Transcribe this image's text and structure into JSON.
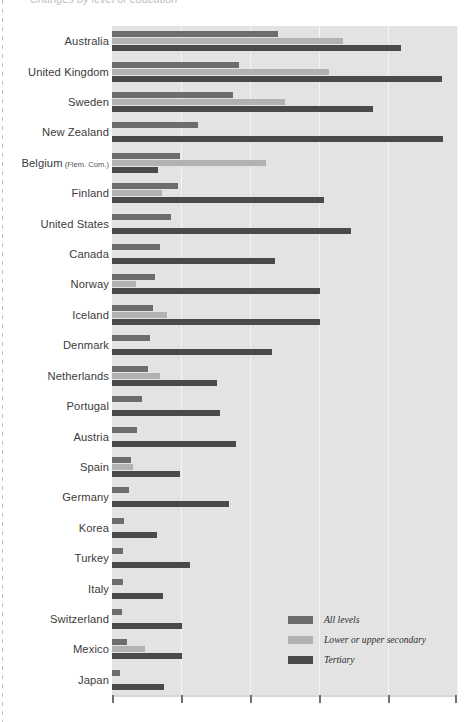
{
  "page": {
    "clipped_title": "Changes by level of education"
  },
  "legend": {
    "position": "inside-bottom-right",
    "items": [
      {
        "label": "All levels",
        "color": "#6d6d6d",
        "swatch_name": "legend-swatch-all-levels"
      },
      {
        "label": "Lower or upper secondary",
        "color": "#b2b2b2",
        "swatch_name": "legend-swatch-lower-upper-secondary"
      },
      {
        "label": "Tertiary",
        "color": "#4a4a4a",
        "swatch_name": "legend-swatch-tertiary"
      }
    ]
  },
  "axis": {
    "tick_count": 6,
    "tick_labels": [
      "",
      "",
      "",
      "",
      "",
      ""
    ],
    "xmin": 0,
    "xmax": 5
  },
  "chart_data": {
    "type": "bar",
    "orientation": "horizontal",
    "title": "Changes by level of education",
    "xlabel": "",
    "ylabel": "",
    "xlim": [
      0,
      5
    ],
    "grid": true,
    "legend_position": "inside-bottom-right",
    "categories": [
      "Australia",
      "United Kingdom",
      "Sweden",
      "New Zealand",
      "Belgium (Flem. Com.)",
      "Finland",
      "United States",
      "Canada",
      "Norway",
      "Iceland",
      "Denmark",
      "Netherlands",
      "Portugal",
      "Austria",
      "Spain",
      "Germany",
      "Korea",
      "Turkey",
      "Italy",
      "Switzerland",
      "Mexico",
      "Japan"
    ],
    "category_sublabels": {
      "Belgium (Flem. Com.)": {
        "main": "Belgium",
        "sub": "(Flem. Com.)"
      }
    },
    "series": [
      {
        "name": "All levels",
        "color": "#6d6d6d",
        "values": [
          2.41,
          1.84,
          1.75,
          1.25,
          0.98,
          0.96,
          0.86,
          0.7,
          0.62,
          0.59,
          0.55,
          0.52,
          0.44,
          0.36,
          0.28,
          0.25,
          0.17,
          0.16,
          0.16,
          0.15,
          0.22,
          0.12
        ]
      },
      {
        "name": "Lower or upper secondary",
        "color": "#b2b2b2",
        "values": [
          3.35,
          3.14,
          2.51,
          0.0,
          2.23,
          0.72,
          0.0,
          0.0,
          0.35,
          0.8,
          0.0,
          0.69,
          0.0,
          0.0,
          0.3,
          0.0,
          0.0,
          0.0,
          0.0,
          0.0,
          0.48,
          0.0
        ]
      },
      {
        "name": "Tertiary",
        "color": "#4a4a4a",
        "values": [
          4.19,
          4.78,
          3.78,
          4.8,
          0.67,
          3.07,
          3.47,
          2.36,
          3.02,
          3.01,
          2.32,
          1.52,
          1.57,
          1.8,
          0.98,
          1.69,
          0.65,
          1.13,
          0.74,
          1.01,
          1.02,
          0.76
        ]
      }
    ]
  }
}
